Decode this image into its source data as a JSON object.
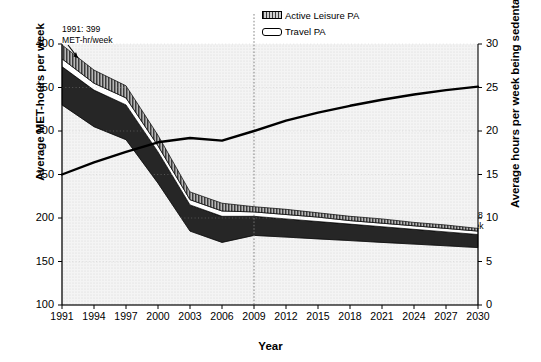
{
  "chart_data": {
    "type": "area",
    "title": "",
    "subtitle": "",
    "xlabel": "Year",
    "ylabel": "Average MET-hours per week",
    "ylabel_right": "Average hours per week being sedentary",
    "xlim": [
      1991,
      2030
    ],
    "ylim": [
      100,
      400
    ],
    "ylim_right": [
      0,
      30
    ],
    "xticks": [
      1991,
      1994,
      1997,
      2000,
      2003,
      2006,
      2009,
      2012,
      2015,
      2018,
      2021,
      2024,
      2027,
      2030
    ],
    "yticks": [
      100,
      150,
      200,
      250,
      300,
      350,
      400
    ],
    "yticks_right": [
      0,
      5,
      10,
      15,
      20,
      25,
      30
    ],
    "grid": true,
    "legend_position": "top-center",
    "stacked": true,
    "x": [
      1991,
      1994,
      1997,
      2000,
      2003,
      2006,
      2009,
      2012,
      2015,
      2018,
      2021,
      2024,
      2027,
      2030
    ],
    "series": [
      {
        "name": "Occupational PA",
        "axis": "left",
        "swatch": "light-dotted",
        "values": [
          330,
          305,
          290,
          240,
          185,
          172,
          180,
          178,
          176,
          174,
          172,
          170,
          168,
          166
        ]
      },
      {
        "name": "Domestic PA",
        "axis": "left",
        "swatch": "dark-solid",
        "values": [
          44,
          42,
          40,
          36,
          30,
          30,
          22,
          21,
          20,
          19,
          18,
          17,
          16,
          15
        ]
      },
      {
        "name": "Travel PA",
        "axis": "left",
        "swatch": "white",
        "values": [
          9,
          8,
          8,
          7,
          6,
          6,
          5,
          5,
          5,
          4,
          4,
          4,
          4,
          4
        ]
      },
      {
        "name": "Active Leisure PA",
        "axis": "left",
        "swatch": "hatched",
        "values": [
          16,
          15,
          14,
          12,
          9,
          9,
          6,
          6,
          5,
          5,
          5,
          4,
          4,
          3
        ]
      },
      {
        "name": "Sedentary Time (hrs/week)",
        "axis": "right",
        "swatch": "black-line",
        "type": "line",
        "values": [
          15.0,
          16.4,
          17.6,
          18.7,
          19.2,
          18.9,
          20.0,
          21.2,
          22.1,
          22.9,
          23.6,
          24.2,
          24.7,
          25.1
        ]
      }
    ],
    "stack_totals": [
      399,
      370,
      352,
      295,
      230,
      217,
      213,
      210,
      206,
      202,
      199,
      195,
      192,
      188
    ],
    "annotations": [
      {
        "id": "anno-1991",
        "line1": "1991: 399",
        "line2": "MET-hr/week",
        "x_year": 1991,
        "value": 399
      },
      {
        "id": "anno-2009",
        "line1": "2009: 213",
        "line2": "MET-hr/week",
        "x_year": 2009,
        "value": 213
      },
      {
        "id": "anno-2020",
        "line1": "by 2020: 200",
        "line2": "MET-hr/week",
        "x_year": 2020,
        "value": 200
      },
      {
        "id": "anno-2030",
        "line1": "by 2030: 188",
        "line2": "MET-hr/week",
        "x_year": 2030,
        "value": 188
      }
    ],
    "reference_line": {
      "x_year": 2009,
      "style": "dotted"
    }
  },
  "legend": {
    "items": [
      {
        "label": "Active Leisure PA",
        "swatch": "hatched"
      },
      {
        "label": "Travel PA",
        "swatch": "white"
      },
      {
        "label": "Domestic PA",
        "swatch": "dark-solid"
      },
      {
        "label": "Occupational PA",
        "swatch": "light-dotted"
      },
      {
        "label": "Sedentary Time (hrs/week)",
        "swatch": "black-line"
      }
    ]
  },
  "colors": {
    "active_leisure": "#4a4a4a",
    "travel": "#ffffff",
    "domestic": "#262626",
    "occupational": "#f0f0f0",
    "sedentary_line": "#000000",
    "axis": "#000000",
    "grid": "#c8c8c8"
  }
}
